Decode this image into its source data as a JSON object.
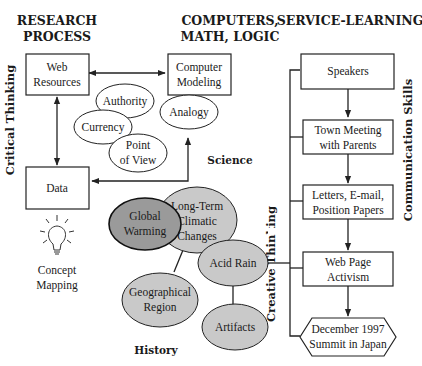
{
  "headers": {
    "research_line1": "RESEARCH",
    "research_line2": "PROCESS",
    "computers_line1": "COMPUTERS,",
    "computers_line2": "MATH, LOGIC",
    "service": "SERVICE-LEARNING"
  },
  "side_labels": {
    "critical_thinking": "Critical Thinking",
    "communication_skills": "Communication Skills",
    "creative_thinking": "Creative Thinking"
  },
  "section_labels": {
    "science": "Science",
    "history": "History"
  },
  "research": {
    "web_resources": [
      "Web",
      "Resources"
    ],
    "data": "Data",
    "criteria": {
      "authority": "Authority",
      "currency": "Currency",
      "point_of_view": [
        "Point",
        "of View"
      ]
    }
  },
  "computers": {
    "computer_modeling": [
      "Computer",
      "Modeling"
    ],
    "analogy": "Analogy"
  },
  "concept_mapping": {
    "icon": "lightbulb-icon",
    "label": [
      "Concept",
      "Mapping"
    ]
  },
  "topics": {
    "global_warming": [
      "Global",
      "Warming"
    ],
    "long_term": [
      "Long-Term",
      "Climatic",
      "Changes"
    ],
    "acid_rain": "Acid Rain",
    "geographical_region": [
      "Geographical",
      "Region"
    ],
    "artifacts": "Artifacts"
  },
  "service_steps": [
    [
      "Speakers"
    ],
    [
      "Town Meeting",
      "with Parents"
    ],
    [
      "Letters, E-mail,",
      "Position Papers"
    ],
    [
      "Web Page",
      "Activism"
    ],
    [
      "December 1997",
      "Summit in Japan"
    ]
  ],
  "colors": {
    "light_gray": "#c9c9c9",
    "dark_gray": "#9a9a9a",
    "line": "#222222"
  }
}
